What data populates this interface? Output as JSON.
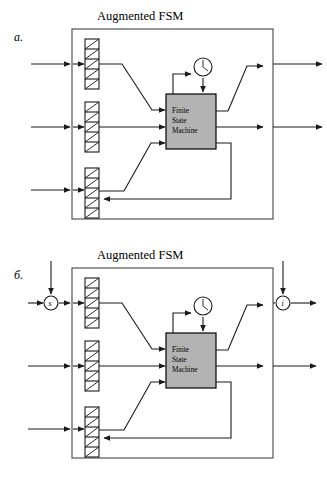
{
  "figure": {
    "type": "diagram",
    "panels": [
      {
        "id": "a",
        "label": "a.",
        "box_title": "Augmented FSM",
        "fsm_block": {
          "lines": [
            "Finite",
            "State",
            "Machine"
          ],
          "fill": "#b3b3b3",
          "stroke": "#000000"
        },
        "clock": {
          "name": "clock-icon",
          "shape": "circle-with-hands"
        },
        "registers": [
          {
            "name": "top-register",
            "cells": 5
          },
          {
            "name": "middle-register",
            "cells": 5
          },
          {
            "name": "bottom-register",
            "cells": 5
          }
        ],
        "external_inputs": 3,
        "external_outputs": 2,
        "has_feedback_loop": true,
        "annotated_nodes": []
      },
      {
        "id": "b",
        "label": "б.",
        "box_title": "Augmented FSM",
        "fsm_block": {
          "lines": [
            "Finite",
            "State",
            "Machine"
          ],
          "fill": "#b3b3b3",
          "stroke": "#000000"
        },
        "clock": {
          "name": "clock-icon",
          "shape": "circle-with-hands"
        },
        "registers": [
          {
            "name": "top-register",
            "cells": 5
          },
          {
            "name": "middle-register",
            "cells": 5
          },
          {
            "name": "bottom-register",
            "cells": 5
          }
        ],
        "external_inputs": 3,
        "external_outputs": 2,
        "has_feedback_loop": true,
        "annotated_nodes": [
          {
            "name": "input-node-s",
            "label": "s",
            "position": "left-input"
          },
          {
            "name": "output-node-i",
            "label": "i",
            "position": "right-output"
          }
        ]
      }
    ],
    "colors": {
      "line": "#1a1a1a",
      "fsm_fill": "#b3b3b3",
      "background": "#ffffff"
    }
  }
}
